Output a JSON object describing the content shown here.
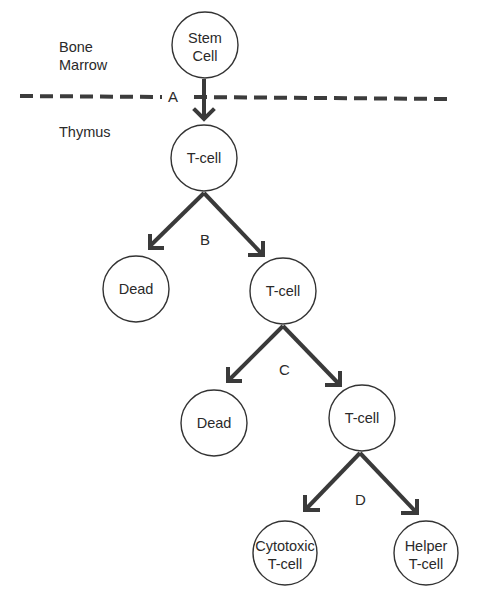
{
  "regions": {
    "bone_marrow": [
      "Bone",
      "Marrow"
    ],
    "thymus": "Thymus"
  },
  "steps": {
    "a": "A",
    "b": "B",
    "c": "C",
    "d": "D"
  },
  "cells": {
    "stem_cell": [
      "Stem",
      "Cell"
    ],
    "tcell_1": "T-cell",
    "dead_1": "Dead",
    "tcell_2": "T-cell",
    "dead_2": "Dead",
    "tcell_3": "T-cell",
    "cytotoxic": [
      "Cytotoxic",
      "T-cell"
    ],
    "helper": [
      "Helper",
      "T-cell"
    ]
  },
  "colors": {
    "stroke": "#333333",
    "arrow": "#3a3a3a",
    "text": "#2a2a2a",
    "background": "#ffffff"
  }
}
